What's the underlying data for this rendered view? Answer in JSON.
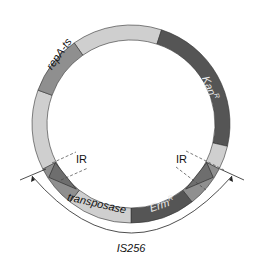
{
  "diagram": {
    "type": "plasmid-map",
    "center": [
      131,
      124
    ],
    "outer_radius": 99,
    "inner_radius": 84,
    "colors": {
      "light": "#cfcfcf",
      "medium": "#8f8f8f",
      "dark": "#555555",
      "ir_triangle": "#6e6e6e",
      "label_on_dark": "#e8e8e8",
      "label_on_light": "#111111"
    },
    "segments": [
      {
        "name": "backbone-top",
        "label": "",
        "start": 325,
        "end": 378,
        "color": "light"
      },
      {
        "name": "kan-r",
        "label": "Kan",
        "sup": "R",
        "start": 18,
        "end": 103,
        "color": "dark"
      },
      {
        "name": "backbone-right",
        "label": "",
        "start": 103,
        "end": 117,
        "color": "light"
      },
      {
        "name": "ir-right-region",
        "label": "",
        "start": 117,
        "end": 142,
        "color": "medium"
      },
      {
        "name": "erm-r",
        "label": "Erm",
        "sup": "R",
        "start": 142,
        "end": 180,
        "color": "dark"
      },
      {
        "name": "transposase",
        "label": "transposase",
        "start": 180,
        "end": 218,
        "color": "light"
      },
      {
        "name": "ir-left-region",
        "label": "",
        "start": 218,
        "end": 243,
        "color": "medium"
      },
      {
        "name": "backbone-left",
        "label": "",
        "start": 243,
        "end": 290,
        "color": "light"
      },
      {
        "name": "repa-ts",
        "label": "repA-ts",
        "start": 290,
        "end": 325,
        "color": "medium"
      }
    ],
    "labels": {
      "repa": "repA-ts",
      "kan": "Kan",
      "kan_sup": "R",
      "erm": "Erm",
      "erm_sup": "R",
      "transposase": "transposase",
      "ir_left": "IR",
      "ir_right": "IR",
      "is256": "IS256"
    }
  }
}
